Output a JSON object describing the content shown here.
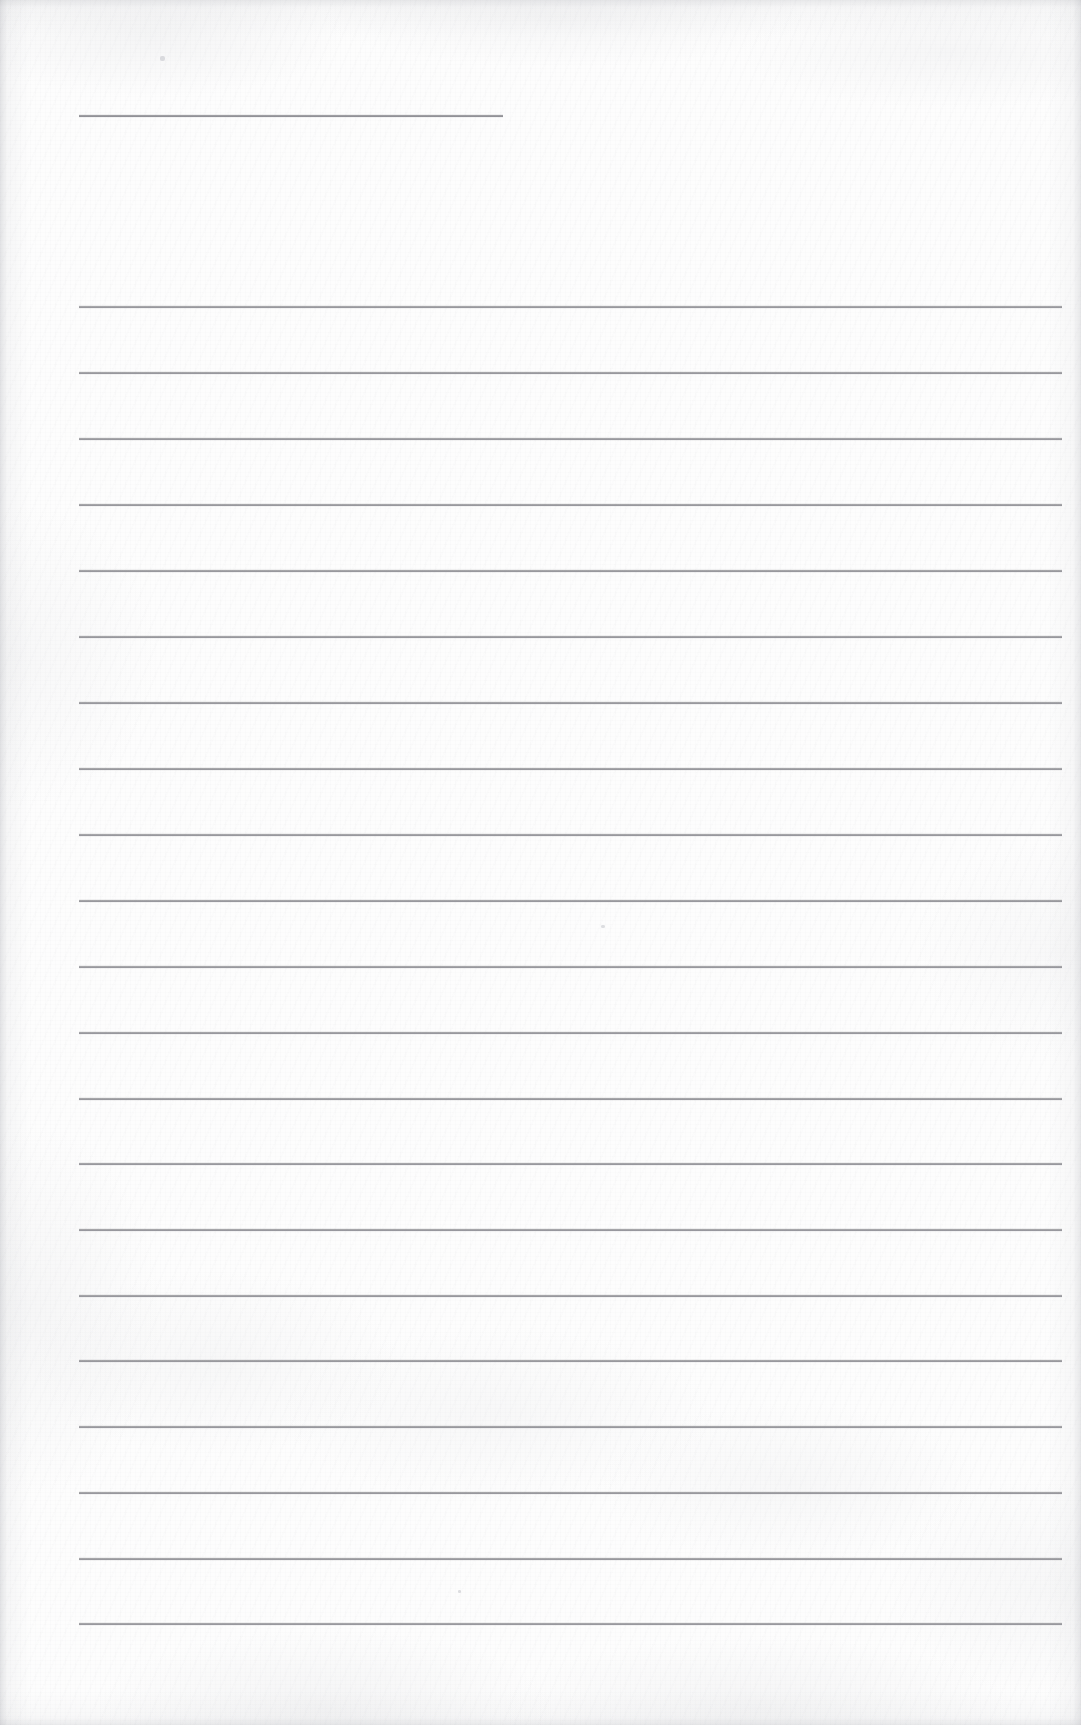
{
  "document": {
    "kind": "scanned-ruled-notebook-page",
    "page_label": "",
    "text_content": "",
    "handwriting_present": false,
    "page_width": 1081,
    "page_height": 1725
  },
  "colors": {
    "paper": "#fdfdfd",
    "rule_line": "#8a8a8e",
    "edge_shadow": "#969aa0",
    "speck": "#96969e"
  },
  "geometry": {
    "rule_left_x": 79,
    "rule_right_x": 1062,
    "rule_thickness": 2,
    "rule_spacing": 66,
    "body_first_rule_y": 306,
    "body_rule_count": 21
  },
  "header_rule": {
    "name": "title-rule",
    "y": 115,
    "left_x": 79,
    "right_x": 503,
    "note": ""
  },
  "body_rules": [
    {
      "index": 1,
      "y": 306
    },
    {
      "index": 2,
      "y": 372
    },
    {
      "index": 3,
      "y": 438
    },
    {
      "index": 4,
      "y": 504
    },
    {
      "index": 5,
      "y": 570
    },
    {
      "index": 6,
      "y": 636
    },
    {
      "index": 7,
      "y": 702
    },
    {
      "index": 8,
      "y": 768
    },
    {
      "index": 9,
      "y": 834
    },
    {
      "index": 10,
      "y": 900
    },
    {
      "index": 11,
      "y": 966
    },
    {
      "index": 12,
      "y": 1032
    },
    {
      "index": 13,
      "y": 1098
    },
    {
      "index": 14,
      "y": 1163
    },
    {
      "index": 15,
      "y": 1229
    },
    {
      "index": 16,
      "y": 1295
    },
    {
      "index": 17,
      "y": 1360
    },
    {
      "index": 18,
      "y": 1426
    },
    {
      "index": 19,
      "y": 1492
    },
    {
      "index": 20,
      "y": 1558
    },
    {
      "index": 21,
      "y": 1623
    }
  ],
  "specks": [
    {
      "x": 160,
      "y": 56,
      "w": 5,
      "h": 5
    },
    {
      "x": 601,
      "y": 925,
      "w": 4,
      "h": 3
    },
    {
      "x": 458,
      "y": 1590,
      "w": 3,
      "h": 3
    }
  ]
}
